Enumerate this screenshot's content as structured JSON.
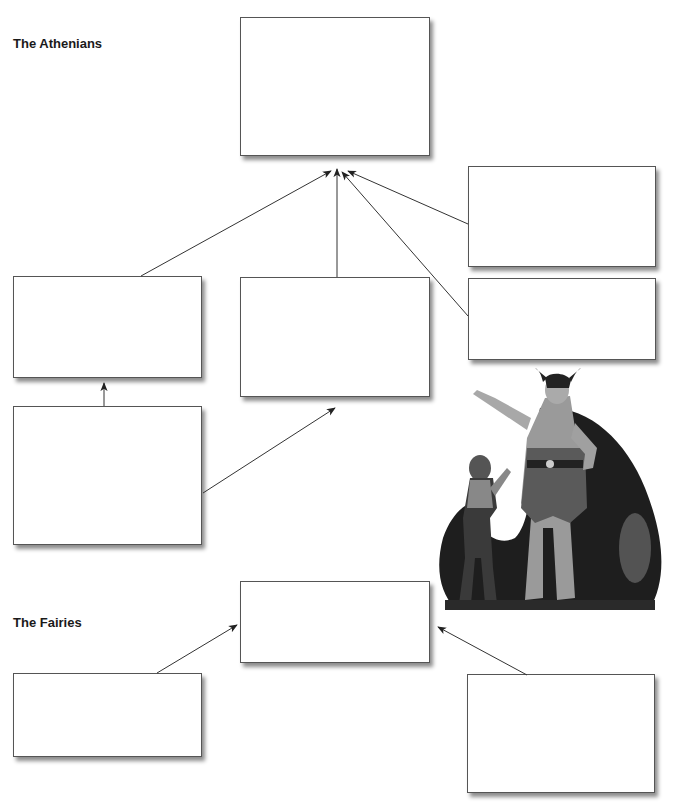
{
  "labels": {
    "athenians": "The Athenians",
    "fairies": "The Fairies"
  },
  "sections": {
    "athenians": {
      "boxes": [
        {
          "id": "athenians-center",
          "text": ""
        },
        {
          "id": "athenians-left",
          "text": ""
        },
        {
          "id": "athenians-lower-left",
          "text": ""
        },
        {
          "id": "athenians-middle",
          "text": ""
        },
        {
          "id": "athenians-right-top",
          "text": ""
        },
        {
          "id": "athenians-right-bottom",
          "text": ""
        }
      ]
    },
    "fairies": {
      "boxes": [
        {
          "id": "fairies-center",
          "text": ""
        },
        {
          "id": "fairies-left",
          "text": ""
        },
        {
          "id": "fairies-right",
          "text": ""
        }
      ]
    }
  },
  "illustration": {
    "subject": "Oberon and Puck fairy illustration",
    "icon": "fairy-characters-illustration"
  },
  "colors": {
    "box_border": "#555555",
    "arrow": "#333333",
    "background": "#ffffff"
  }
}
